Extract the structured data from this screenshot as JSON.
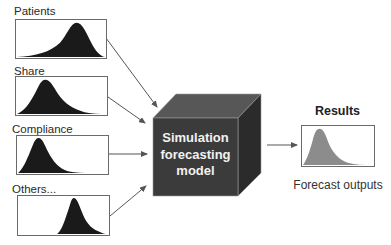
{
  "inputs": [
    {
      "label": "Patients",
      "shape": "left-skew",
      "peak_x": 0.68
    },
    {
      "label": "Share",
      "shape": "right-skew",
      "peak_x": 0.3
    },
    {
      "label": "Compliance",
      "shape": "right-skew",
      "peak_x": 0.25
    },
    {
      "label": "Others...",
      "shape": "right-skew",
      "peak_x": 0.58
    }
  ],
  "model": {
    "lines": [
      "Simulation",
      "forecasting",
      "model"
    ],
    "colors": {
      "front": "#3b3b3b",
      "top": "#575757",
      "side": "#2b2b2b"
    }
  },
  "output": {
    "title": "Results",
    "caption": "Forecast outputs",
    "fill_color": "#8c8c8c"
  },
  "colors": {
    "input_fill": "#1a1a1a",
    "border": "#6a6a6a",
    "arrow": "#555555"
  }
}
